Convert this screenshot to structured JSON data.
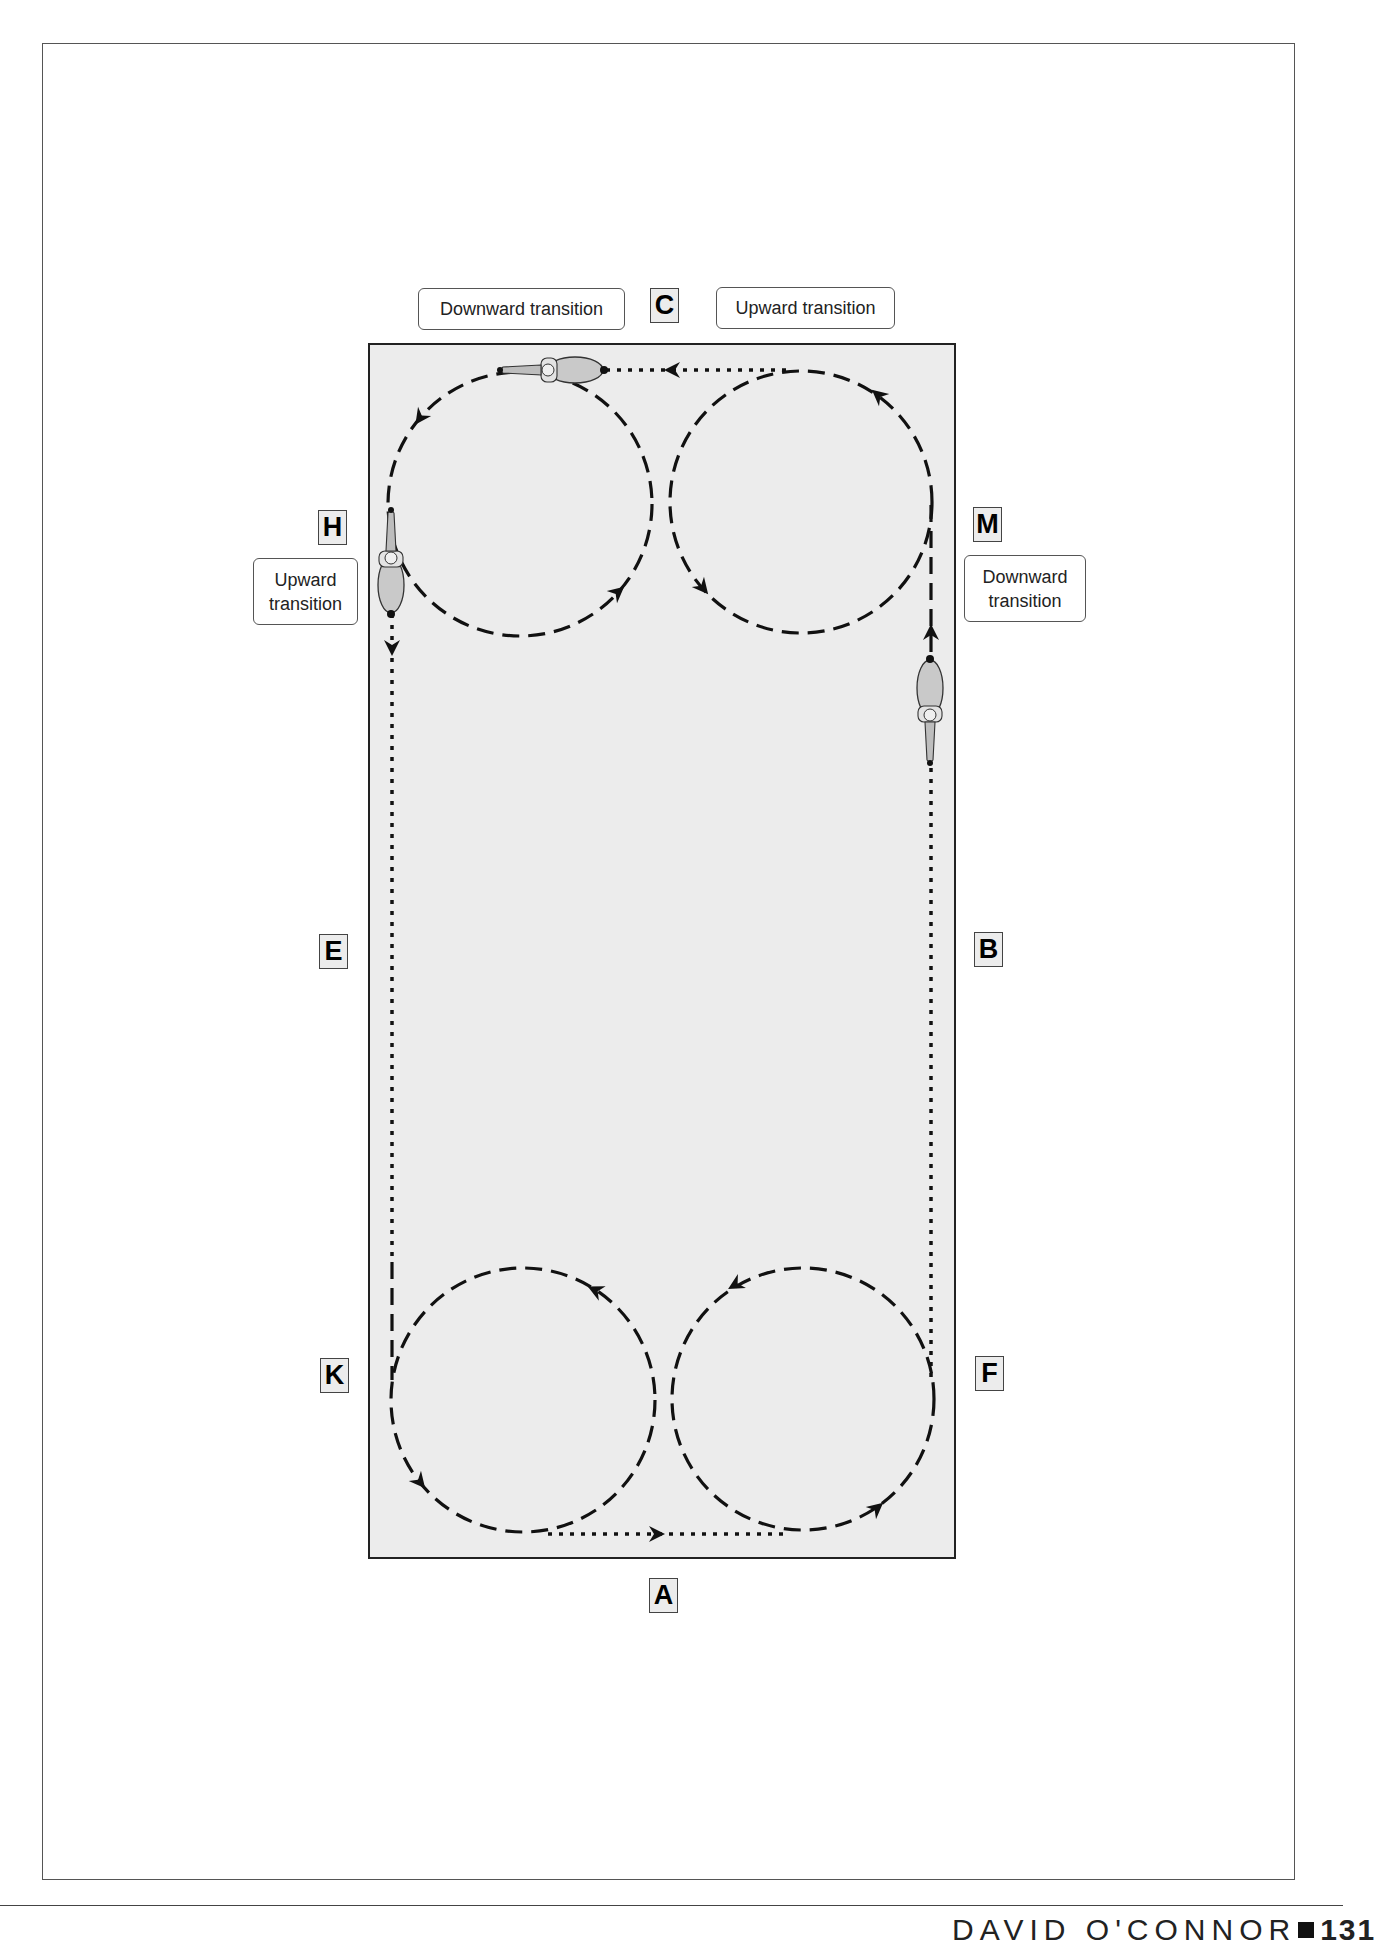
{
  "figure": {
    "arena_letters": {
      "C": "C",
      "H": "H",
      "M": "M",
      "E": "E",
      "B": "B",
      "K": "K",
      "F": "F",
      "A": "A"
    },
    "callouts": {
      "top_left": "Downward transition",
      "top_right": "Upward transition",
      "left_line1": "Upward",
      "left_line2": "transition",
      "right_line1": "Downward",
      "right_line2": "transition"
    },
    "colors": {
      "arena_fill": "#ececec",
      "track": "#111111",
      "border": "#222222"
    },
    "icons": [
      "horse-rider-top",
      "horse-rider-left",
      "horse-rider-right"
    ]
  },
  "footer": {
    "author": "DAVID O'CONNOR",
    "page": "131"
  }
}
